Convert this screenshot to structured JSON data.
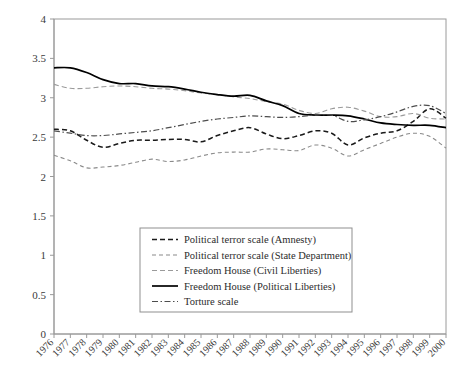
{
  "chart_data": {
    "type": "line",
    "title": "",
    "subtitle": "",
    "xlabel": "",
    "ylabel": "",
    "grid": false,
    "legend_position": "inside-bottom-center",
    "xlim": [
      1976,
      2000
    ],
    "ylim": [
      0,
      4
    ],
    "ytick_labels": [
      "0",
      "0.5",
      "1",
      "1.5",
      "2",
      "2.5",
      "3",
      "3.5",
      "4"
    ],
    "ytick_values": [
      0,
      0.5,
      1,
      1.5,
      2,
      2.5,
      3,
      3.5,
      4
    ],
    "x": [
      1976,
      1977,
      1978,
      1979,
      1980,
      1981,
      1982,
      1983,
      1984,
      1985,
      1986,
      1987,
      1988,
      1989,
      1990,
      1991,
      1992,
      1993,
      1994,
      1995,
      1996,
      1997,
      1998,
      1999,
      2000
    ],
    "xtick_labels": [
      "1976",
      "1977",
      "1978",
      "1979",
      "1980",
      "1981",
      "1982",
      "1983",
      "1984",
      "1985",
      "1986",
      "1987",
      "1988",
      "1989",
      "1990",
      "1991",
      "1992",
      "1993",
      "1994",
      "1995",
      "1996",
      "1997",
      "1998",
      "1999",
      "2000"
    ],
    "series": [
      {
        "name": "Political terror scale (Amnesty)",
        "style": "dashed",
        "color": "#1a1a1a",
        "values": [
          2.6,
          2.58,
          2.46,
          2.37,
          2.42,
          2.46,
          2.46,
          2.47,
          2.47,
          2.44,
          2.52,
          2.58,
          2.62,
          2.54,
          2.48,
          2.52,
          2.58,
          2.55,
          2.4,
          2.49,
          2.55,
          2.58,
          2.7,
          2.86,
          2.74
        ]
      },
      {
        "name": "Political terror scale (State Department)",
        "style": "dashed-light",
        "color": "#8a8a8a",
        "values": [
          2.27,
          2.2,
          2.11,
          2.12,
          2.14,
          2.18,
          2.22,
          2.19,
          2.21,
          2.26,
          2.3,
          2.31,
          2.31,
          2.35,
          2.34,
          2.33,
          2.4,
          2.36,
          2.26,
          2.34,
          2.42,
          2.5,
          2.55,
          2.51,
          2.36
        ]
      },
      {
        "name": "Freedom House (Civil Liberties)",
        "style": "dashed-grey",
        "color": "#9a9a9a",
        "values": [
          3.17,
          3.12,
          3.12,
          3.14,
          3.15,
          3.14,
          3.12,
          3.11,
          3.09,
          3.06,
          3.04,
          3.01,
          2.99,
          2.95,
          2.92,
          2.84,
          2.8,
          2.86,
          2.88,
          2.83,
          2.76,
          2.76,
          2.8,
          2.74,
          2.73
        ]
      },
      {
        "name": "Freedom House (Political Liberties)",
        "style": "solid",
        "color": "#000000",
        "values": [
          3.38,
          3.38,
          3.32,
          3.23,
          3.18,
          3.18,
          3.15,
          3.14,
          3.11,
          3.07,
          3.04,
          3.02,
          3.03,
          2.96,
          2.9,
          2.8,
          2.78,
          2.78,
          2.77,
          2.73,
          2.68,
          2.66,
          2.65,
          2.65,
          2.62
        ]
      },
      {
        "name": "Torture scale",
        "style": "dash-dot",
        "color": "#4d4d4d",
        "values": [
          2.58,
          2.55,
          2.52,
          2.52,
          2.54,
          2.56,
          2.58,
          2.62,
          2.66,
          2.7,
          2.73,
          2.75,
          2.77,
          2.76,
          2.75,
          2.76,
          2.78,
          2.78,
          2.7,
          2.72,
          2.76,
          2.82,
          2.89,
          2.9,
          2.8
        ]
      }
    ]
  },
  "legend": {
    "items": [
      {
        "label": "Political terror scale (Amnesty)"
      },
      {
        "label": "Political terror scale (State Department)"
      },
      {
        "label": "Freedom House (Civil Liberties)"
      },
      {
        "label": "Freedom House (Political Liberties)"
      },
      {
        "label": "Torture scale"
      }
    ]
  }
}
